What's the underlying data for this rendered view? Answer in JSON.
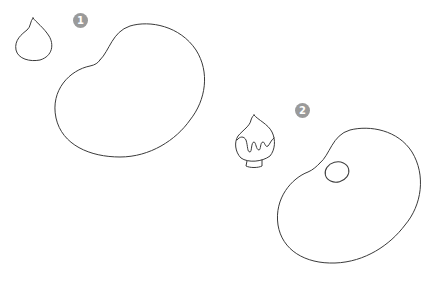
{
  "steps": [
    {
      "number": "1",
      "description": "Draw a drop shape and a large bean-shaped palette outline"
    },
    {
      "number": "2",
      "description": "Add drips and a base to the drop; add a thumb hole to the palette"
    }
  ],
  "colors": {
    "line": "#3a3a3a",
    "badge": "#9a9a9a",
    "background": "#ffffff"
  }
}
